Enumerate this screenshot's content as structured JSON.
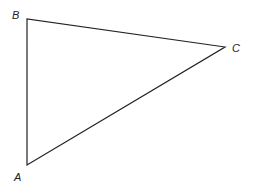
{
  "diagram": {
    "type": "triangle",
    "stroke_color": "#222222",
    "vertices": [
      {
        "label": "A",
        "x": 27,
        "y": 165
      },
      {
        "label": "B",
        "x": 27,
        "y": 19
      },
      {
        "label": "C",
        "x": 225,
        "y": 47
      }
    ],
    "edges": [
      {
        "from": "A",
        "to": "B"
      },
      {
        "from": "B",
        "to": "C"
      },
      {
        "from": "C",
        "to": "A"
      }
    ],
    "labels": {
      "a": "A",
      "b": "B",
      "c": "C"
    }
  }
}
